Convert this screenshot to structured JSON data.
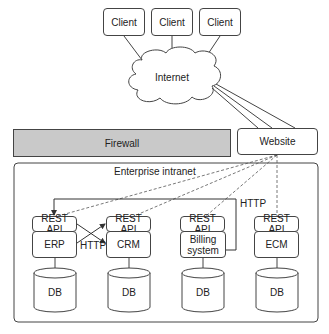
{
  "clients": [
    {
      "label": "Client"
    },
    {
      "label": "Client"
    },
    {
      "label": "Client"
    }
  ],
  "internet": {
    "label": "Internet"
  },
  "firewall": {
    "label": "Firewall",
    "fill": "#c9c9c9"
  },
  "website": {
    "label": "Website"
  },
  "intranet": {
    "label": "Enterprise intranet"
  },
  "systems": [
    {
      "api": "REST API",
      "name": "ERP",
      "db": "DB"
    },
    {
      "api": "REST API",
      "name": "CRM",
      "db": "DB"
    },
    {
      "api": "REST API",
      "name": "Billing system",
      "name_line1": "Billing",
      "name_line2": "system",
      "db": "DB"
    },
    {
      "api": "REST API",
      "name": "ECM",
      "db": "DB"
    }
  ],
  "connections": {
    "erp_crm_label": "HTTP",
    "billing_erp_label": "HTTP"
  }
}
